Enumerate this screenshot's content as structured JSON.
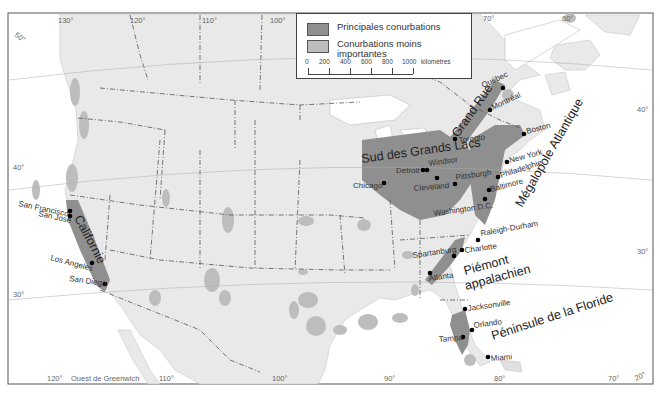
{
  "legend": {
    "items": [
      {
        "label": "Principales conurbations",
        "color": "#8f8f8f"
      },
      {
        "label": "Conurbations moins importantes",
        "color": "#bdbdbd"
      }
    ],
    "scale": {
      "ticks": [
        "0",
        "200",
        "400",
        "600",
        "800",
        "1000"
      ],
      "unit": "kilomètres"
    }
  },
  "graticule": {
    "top_longitudes": [
      "130°",
      "120°",
      "110°",
      "100°",
      "70°",
      "60°"
    ],
    "bottom_longitudes": [
      "120°",
      "110°",
      "100°",
      "90°",
      "80°",
      "70°"
    ],
    "bottom_note": "Ouest de Greenwich",
    "left_latitudes": [
      "50°",
      "40°",
      "30°"
    ],
    "right_latitudes": [
      "40°",
      "30°",
      "20°"
    ]
  },
  "regions": [
    {
      "name": "Californie"
    },
    {
      "name": "Sud des Grands Lacs"
    },
    {
      "name": "Grand Rue"
    },
    {
      "name": "Mégalopole Atlantique"
    },
    {
      "name": "Piémont appalachien",
      "line1": "Piémont",
      "line2": "appalachien"
    },
    {
      "name": "Péninsule de la Floride"
    }
  ],
  "cities": [
    {
      "name": "San Francisco"
    },
    {
      "name": "San José"
    },
    {
      "name": "Los Angeles"
    },
    {
      "name": "San Diego"
    },
    {
      "name": "Chicago"
    },
    {
      "name": "Detroit"
    },
    {
      "name": "Windsor"
    },
    {
      "name": "Cleveland"
    },
    {
      "name": "Pittsburgh"
    },
    {
      "name": "Toronto"
    },
    {
      "name": "Québec"
    },
    {
      "name": "Montréal"
    },
    {
      "name": "Boston"
    },
    {
      "name": "New York"
    },
    {
      "name": "Philadelphie"
    },
    {
      "name": "Baltimore"
    },
    {
      "name": "Washington D.C."
    },
    {
      "name": "Raleigh-Durham"
    },
    {
      "name": "Charlotte"
    },
    {
      "name": "Spartanburg"
    },
    {
      "name": "Atlanta"
    },
    {
      "name": "Jacksonville"
    },
    {
      "name": "Orlando"
    },
    {
      "name": "Tampa"
    },
    {
      "name": "Miami"
    }
  ],
  "colors": {
    "land": "#e9e9e9",
    "water": "#ffffff",
    "major": "#8f8f8f",
    "minor": "#bdbdbd",
    "border": "#555555"
  }
}
